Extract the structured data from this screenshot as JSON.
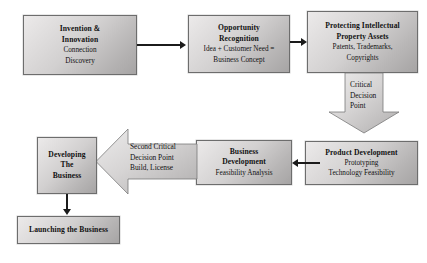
{
  "diagram": {
    "theme": {
      "box_fill_light": "#eceaea",
      "box_fill_dark": "#a6a4a4",
      "box_border": "#6d6d6d",
      "arrow_color": "#1b1b1b",
      "background": "#ffffff"
    },
    "nodes": [
      {
        "id": "invention",
        "title_line1": "Invention &",
        "title_line2": "Innovation",
        "sub_line1": "Connection",
        "sub_line2": "Discovery"
      },
      {
        "id": "opportunity",
        "title_line1": "Opportunity",
        "title_line2": "Recognition",
        "sub_line1": "Idea + Customer Need =",
        "sub_line2": "Business Concept"
      },
      {
        "id": "ip",
        "title_line1": "Protecting Intellectual",
        "title_line2": "Property Assets",
        "sub_line1": "Patents, Trademarks,",
        "sub_line2": "Copyrights"
      },
      {
        "id": "product-development",
        "title_line1": "Product Development",
        "sub_line1": "Prototyping",
        "sub_line2": "Technology Feasibility"
      },
      {
        "id": "business-development",
        "title_line1": "Business",
        "title_line2": "Development",
        "sub_line1": "Feasibility Analysis"
      },
      {
        "id": "developing-the-business",
        "title_line1": "Developing",
        "title_line2": "The",
        "title_line3": "Business"
      },
      {
        "id": "launching-the-business",
        "title_line1": "Launching the Business"
      }
    ],
    "block_arrows": [
      {
        "id": "critical-decision-point",
        "direction": "down",
        "line1": "Critical",
        "line2": "Decision",
        "line3": "Point"
      },
      {
        "id": "second-critical-decision-point",
        "direction": "left",
        "line1": "Second Critical",
        "line2": "Decision Point",
        "line3": "Build, License"
      }
    ],
    "connectors": [
      {
        "id": "invention-to-opportunity",
        "direction": "right"
      },
      {
        "id": "opportunity-to-ip",
        "direction": "right"
      },
      {
        "id": "product-dev-to-business-dev",
        "direction": "left"
      },
      {
        "id": "developing-to-launching",
        "direction": "down"
      }
    ]
  }
}
